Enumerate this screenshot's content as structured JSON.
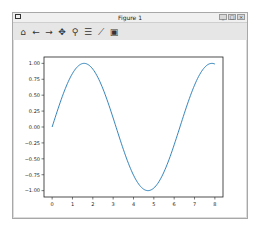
{
  "window": {
    "title": "Figure 1",
    "controls": {
      "minimize": "_",
      "maximize": "□",
      "close": "×"
    }
  },
  "toolbar": {
    "buttons": [
      {
        "name": "home",
        "glyph": "⌂"
      },
      {
        "name": "back",
        "glyph": "←"
      },
      {
        "name": "forward",
        "glyph": "→"
      },
      {
        "name": "pan",
        "glyph": "✥"
      },
      {
        "name": "zoom",
        "glyph": "⚲"
      },
      {
        "name": "configure-subplots",
        "glyph": "☰"
      },
      {
        "name": "edit-axes",
        "glyph": "⟋"
      },
      {
        "name": "save",
        "glyph": "▣"
      }
    ]
  },
  "chart_data": {
    "type": "line",
    "title": "",
    "xlabel": "",
    "ylabel": "",
    "xlim": [
      -0.4,
      8.4
    ],
    "ylim": [
      -1.1,
      1.1
    ],
    "x_ticks": [
      "0",
      "1",
      "2",
      "3",
      "4",
      "5",
      "6",
      "7",
      "8"
    ],
    "y_ticks": [
      "1.00",
      "0.75",
      "0.50",
      "0.25",
      "0.00",
      "−0.25",
      "−0.50",
      "−0.75",
      "−1.00"
    ],
    "grid": false,
    "legend": null,
    "series": [
      {
        "name": "sin(x)",
        "color": "#1f77b4",
        "x": [
          0,
          0.5,
          1,
          1.5,
          1.5708,
          2,
          2.5,
          3,
          3.5,
          4,
          4.5,
          4.7124,
          5,
          5.5,
          6,
          6.5,
          7,
          7.5,
          7.854,
          8
        ],
        "y": [
          0,
          0.479,
          0.841,
          0.997,
          1.0,
          0.909,
          0.598,
          0.141,
          -0.351,
          -0.757,
          -0.978,
          -1.0,
          -0.959,
          -0.706,
          -0.279,
          0.215,
          0.657,
          0.938,
          1.0,
          0.989
        ]
      }
    ]
  }
}
